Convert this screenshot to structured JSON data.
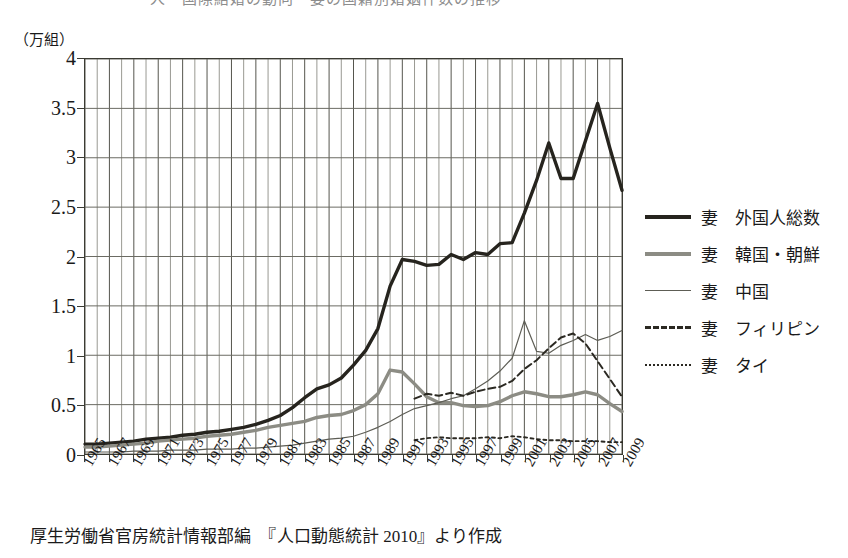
{
  "title_strip": "人　国際結婚の動向　妻の国籍別婚姻件数の推移",
  "y_unit": "（万組）",
  "source": "厚生労働省官房統計情報部編　『人口動態統計 2010』より作成",
  "legend": {
    "items": [
      {
        "label": "妻　外国人総数",
        "style": "total",
        "color": "#26241e"
      },
      {
        "label": "妻　韓国・朝鮮",
        "style": "korea",
        "color": "#8c8c84"
      },
      {
        "label": "妻　中国",
        "style": "china",
        "color": "#5d5d55"
      },
      {
        "label": "妻　フィリピン",
        "style": "phil",
        "color": "#2b2922"
      },
      {
        "label": "妻　タイ",
        "style": "thai",
        "color": "#2b2922"
      }
    ]
  },
  "chart_data": {
    "type": "line",
    "title": "妻の国籍別婚姻件数の推移",
    "xlabel": "",
    "ylabel": "万組",
    "ylim": [
      0,
      4
    ],
    "ytick_labels": [
      "0",
      "0.5",
      "1",
      "1.5",
      "2",
      "2.5",
      "3",
      "3.5",
      "4"
    ],
    "yticks": [
      0,
      0.5,
      1,
      1.5,
      2,
      2.5,
      3,
      3.5,
      4
    ],
    "xlim": [
      1965,
      2009
    ],
    "xtick_labels": [
      "1965",
      "1967",
      "1969",
      "1971",
      "1973",
      "1975",
      "1977",
      "1979",
      "1981",
      "1983",
      "1985",
      "1987",
      "1989",
      "1991",
      "1993",
      "1995",
      "1997",
      "1999",
      "2001",
      "2003",
      "2005",
      "2007",
      "2009"
    ],
    "xticks": [
      1965,
      1967,
      1969,
      1971,
      1973,
      1975,
      1977,
      1979,
      1981,
      1983,
      1985,
      1987,
      1989,
      1991,
      1993,
      1995,
      1997,
      1999,
      2001,
      2003,
      2005,
      2007,
      2009
    ],
    "grid": "both",
    "legend_position": "right",
    "x": [
      1965,
      1966,
      1967,
      1968,
      1969,
      1970,
      1971,
      1972,
      1973,
      1974,
      1975,
      1976,
      1977,
      1978,
      1979,
      1980,
      1981,
      1982,
      1983,
      1984,
      1985,
      1986,
      1987,
      1988,
      1989,
      1990,
      1991,
      1992,
      1993,
      1994,
      1995,
      1996,
      1997,
      1998,
      1999,
      2000,
      2001,
      2002,
      2003,
      2004,
      2005,
      2006,
      2007,
      2008,
      2009
    ],
    "series": [
      {
        "name": "妻 外国人総数",
        "style": "total",
        "color": "#26241e",
        "values": [
          0.1,
          0.1,
          0.11,
          0.12,
          0.13,
          0.15,
          0.16,
          0.17,
          0.19,
          0.2,
          0.22,
          0.23,
          0.25,
          0.27,
          0.3,
          0.34,
          0.39,
          0.47,
          0.57,
          0.66,
          0.7,
          0.77,
          0.9,
          1.05,
          1.27,
          1.7,
          1.97,
          1.95,
          1.91,
          1.92,
          2.02,
          1.97,
          2.04,
          2.02,
          2.13,
          2.14,
          2.44,
          2.77,
          3.15,
          2.79,
          2.79,
          3.17,
          3.55,
          3.1,
          2.67
        ]
      },
      {
        "name": "妻 韓国・朝鮮",
        "style": "korea",
        "color": "#8c8c84",
        "values": [
          0.07,
          0.07,
          0.08,
          0.09,
          0.1,
          0.11,
          0.13,
          0.14,
          0.15,
          0.16,
          0.18,
          0.19,
          0.2,
          0.22,
          0.24,
          0.27,
          0.29,
          0.31,
          0.33,
          0.37,
          0.39,
          0.4,
          0.44,
          0.5,
          0.61,
          0.85,
          0.83,
          0.71,
          0.58,
          0.52,
          0.52,
          0.49,
          0.48,
          0.49,
          0.53,
          0.59,
          0.63,
          0.61,
          0.58,
          0.58,
          0.6,
          0.63,
          0.6,
          0.51,
          0.43
        ]
      },
      {
        "name": "妻 中国",
        "style": "china",
        "color": "#5d5d55",
        "values": [
          0.02,
          0.02,
          0.02,
          0.02,
          0.03,
          0.03,
          0.03,
          0.04,
          0.04,
          0.04,
          0.05,
          0.05,
          0.05,
          0.06,
          0.06,
          0.07,
          0.08,
          0.09,
          0.11,
          0.13,
          0.15,
          0.16,
          0.18,
          0.22,
          0.27,
          0.33,
          0.4,
          0.46,
          0.49,
          0.52,
          0.56,
          0.59,
          0.66,
          0.74,
          0.84,
          0.97,
          1.35,
          1.04,
          1.02,
          1.1,
          1.15,
          1.21,
          1.15,
          1.19,
          1.25
        ]
      },
      {
        "name": "妻 フィリピン",
        "style": "phil",
        "color": "#2b2922",
        "values": [
          null,
          null,
          null,
          null,
          null,
          null,
          null,
          null,
          null,
          null,
          null,
          null,
          null,
          null,
          null,
          null,
          null,
          null,
          null,
          null,
          null,
          null,
          null,
          null,
          null,
          null,
          null,
          0.56,
          0.61,
          0.59,
          0.62,
          0.59,
          0.63,
          0.66,
          0.68,
          0.74,
          0.86,
          0.95,
          1.07,
          1.18,
          1.22,
          1.12,
          0.94,
          0.76,
          0.58
        ]
      },
      {
        "name": "妻 タイ",
        "style": "thai",
        "color": "#2b2922",
        "values": [
          null,
          null,
          null,
          null,
          null,
          null,
          null,
          null,
          null,
          null,
          null,
          null,
          null,
          null,
          null,
          null,
          null,
          null,
          null,
          null,
          null,
          null,
          null,
          null,
          null,
          null,
          null,
          0.14,
          0.16,
          0.17,
          0.16,
          0.16,
          0.16,
          0.17,
          0.16,
          0.18,
          0.17,
          0.15,
          0.14,
          0.14,
          0.13,
          0.13,
          0.13,
          0.12,
          0.12
        ]
      }
    ]
  }
}
